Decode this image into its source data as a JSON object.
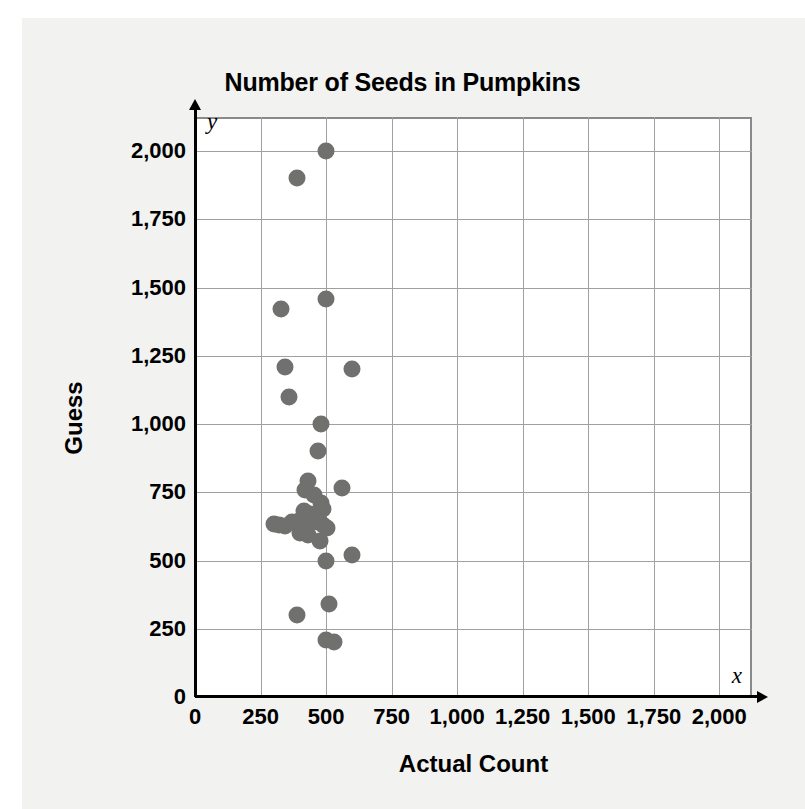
{
  "chart_data": {
    "type": "scatter",
    "title": "Number of Seeds in Pumpkins",
    "xlabel": "Actual Count",
    "ylabel": "Guess",
    "x_axis_variable": "x",
    "y_axis_variable": "y",
    "xlim": [
      0,
      2125
    ],
    "ylim": [
      0,
      2125
    ],
    "xticks": [
      0,
      250,
      500,
      750,
      1000,
      1250,
      1500,
      1750,
      2000
    ],
    "xtick_labels": [
      "0",
      "250",
      "500",
      "750",
      "1,000",
      "1,250",
      "1,500",
      "1,750",
      "2,000"
    ],
    "yticks": [
      0,
      250,
      500,
      750,
      1000,
      1250,
      1500,
      1750,
      2000
    ],
    "ytick_labels": [
      "0",
      "250",
      "500",
      "750",
      "1,000",
      "1,250",
      "1,500",
      "1,750",
      "2,000"
    ],
    "grid": true,
    "legend": null,
    "marker_color": "#70706e",
    "points": [
      [
        500,
        2000
      ],
      [
        390,
        1900
      ],
      [
        500,
        1460
      ],
      [
        330,
        1420
      ],
      [
        345,
        1210
      ],
      [
        600,
        1200
      ],
      [
        360,
        1100
      ],
      [
        480,
        1000
      ],
      [
        470,
        900
      ],
      [
        430,
        790
      ],
      [
        420,
        760
      ],
      [
        560,
        765
      ],
      [
        455,
        740
      ],
      [
        480,
        710
      ],
      [
        490,
        690
      ],
      [
        415,
        680
      ],
      [
        440,
        670
      ],
      [
        300,
        635
      ],
      [
        320,
        630
      ],
      [
        345,
        628
      ],
      [
        370,
        640
      ],
      [
        395,
        645
      ],
      [
        420,
        635
      ],
      [
        455,
        640
      ],
      [
        490,
        630
      ],
      [
        505,
        620
      ],
      [
        400,
        600
      ],
      [
        430,
        595
      ],
      [
        475,
        570
      ],
      [
        500,
        500
      ],
      [
        600,
        520
      ],
      [
        510,
        340
      ],
      [
        390,
        300
      ],
      [
        500,
        210
      ],
      [
        530,
        200
      ]
    ]
  }
}
